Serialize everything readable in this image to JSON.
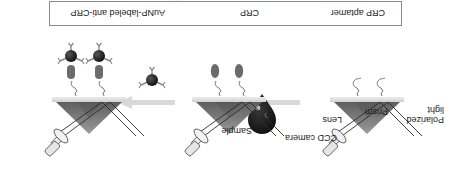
{
  "figure": {
    "orientation": "rotated-180",
    "labels": {
      "polarized_light": "Polarized light",
      "polarized": "Polarized",
      "light": "light",
      "prism": "Prism",
      "lens": "Lens",
      "ccd_camera": "CCD camera",
      "sample": "Sample"
    },
    "panels": [
      {
        "step": 1,
        "surface": "CRP aptamer immobilized"
      },
      {
        "step": 2,
        "surface": "CRP bound to aptamer"
      },
      {
        "step": 3,
        "surface": "AuNP-labeled anti-CRP bound"
      }
    ],
    "legend": {
      "items": [
        {
          "icon": "aptamer-icon",
          "label": "CRP aptamer"
        },
        {
          "icon": "crp-icon",
          "label": "CRP"
        },
        {
          "icon": "aunp-antibody-icon",
          "label": "AuNP-labeled anti-CRP"
        }
      ]
    },
    "colors": {
      "prism_dark": "#6e6e6e",
      "prism_light": "#b8b8b8",
      "arrow": "#d8d8d8",
      "crp": "#6b6b6b",
      "aunp": "#1e1e1e",
      "sample_drop": "#151515"
    }
  }
}
